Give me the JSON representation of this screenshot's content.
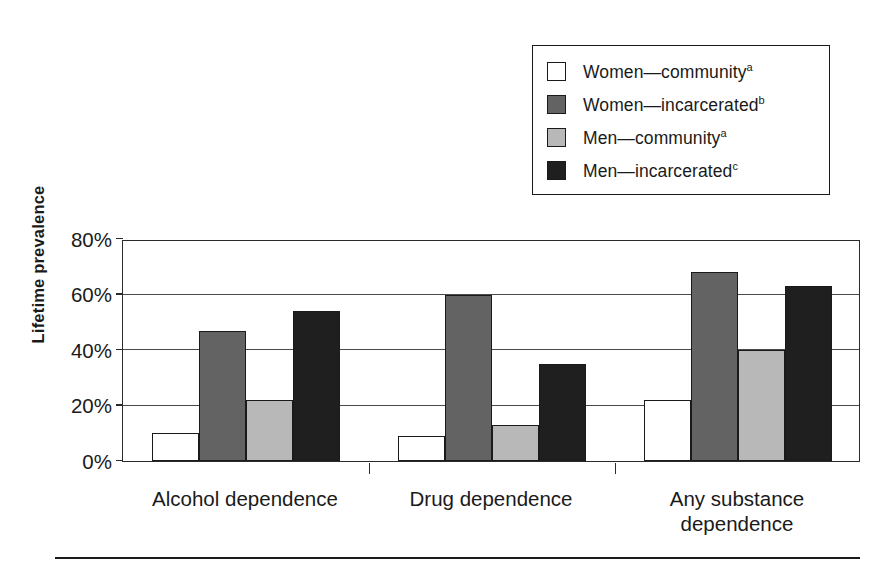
{
  "chart_data": {
    "type": "bar",
    "title": "",
    "xlabel": "",
    "ylabel": "Lifetime prevalence",
    "categories": [
      "Alcohol dependence",
      "Drug dependence",
      "Any substance\ndependence"
    ],
    "ylim": [
      0,
      80
    ],
    "yticks": [
      0,
      20,
      40,
      60,
      80
    ],
    "ytick_labels": [
      "0%",
      "20%",
      "40%",
      "60%",
      "80%"
    ],
    "grid": true,
    "legend_position": "top-right",
    "series": [
      {
        "name": "Women—community",
        "footnote": "a",
        "color": "#ffffff",
        "values": [
          10,
          9,
          22
        ]
      },
      {
        "name": "Women—incarcerated",
        "footnote": "b",
        "color": "#636363",
        "values": [
          47,
          60,
          68
        ]
      },
      {
        "name": "Men—community",
        "footnote": "a",
        "color": "#b8b8b8",
        "values": [
          22,
          13,
          40
        ]
      },
      {
        "name": "Men—incarcerated",
        "footnote": "c",
        "color": "#1f1f1f",
        "values": [
          54,
          35,
          63
        ]
      }
    ]
  },
  "legend": {
    "items": [
      {
        "label": "Women—community",
        "footnote": "a",
        "color": "#ffffff"
      },
      {
        "label": "Women—incarcerated",
        "footnote": "b",
        "color": "#636363"
      },
      {
        "label": "Men—community",
        "footnote": "a",
        "color": "#b8b8b8"
      },
      {
        "label": "Men—incarcerated",
        "footnote": "c",
        "color": "#1f1f1f"
      }
    ]
  },
  "axis": {
    "y_title": "Lifetime prevalence"
  },
  "colors": {
    "axis": "#2b2b2b",
    "grid": "#4a4a4a",
    "outline": "#1a1a1a",
    "background": "#ffffff"
  }
}
